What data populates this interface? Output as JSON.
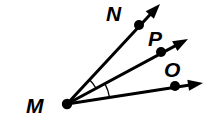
{
  "figure": {
    "type": "geometry-figure",
    "background_color": "#ffffff",
    "stroke_color": "#000000",
    "canvas": {
      "width": 215,
      "height": 131
    },
    "vertex": {
      "name": "M",
      "label": "M",
      "label_x": 26,
      "label_y": 113,
      "dot_x": 67,
      "dot_y": 104,
      "dot_r": 5.2
    },
    "rays": [
      {
        "name": "ray-MN",
        "label": "N",
        "label_x": 106,
        "label_y": 21,
        "point_x": 139,
        "point_y": 25,
        "point_r": 5.0,
        "tip_x": 160,
        "tip_y": 4,
        "stroke_width": 3.0
      },
      {
        "name": "ray-MP",
        "label": "P",
        "label_x": 148,
        "label_y": 46,
        "point_x": 161,
        "point_y": 52,
        "point_r": 5.0,
        "tip_x": 188,
        "tip_y": 39,
        "stroke_width": 3.0
      },
      {
        "name": "ray-MO",
        "label": "O",
        "label_x": 164,
        "label_y": 77,
        "point_x": 175,
        "point_y": 86,
        "point_r": 5.0,
        "tip_x": 203,
        "tip_y": 83,
        "stroke_width": 3.0
      }
    ],
    "arcs": [
      {
        "name": "arc-NMP",
        "between": "N-M-P",
        "radius": 33,
        "stroke_width": 1.3
      },
      {
        "name": "arc-PMO",
        "between": "P-M-O",
        "radius": 43,
        "stroke_width": 1.3
      }
    ]
  }
}
